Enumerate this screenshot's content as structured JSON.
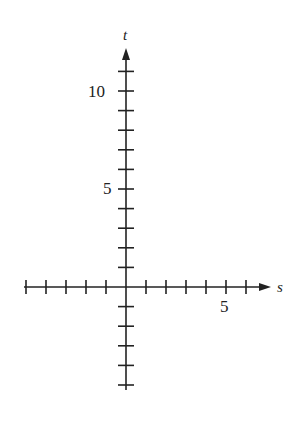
{
  "diagram": {
    "type": "coordinate-axes",
    "horizontal_axis": {
      "label": "s",
      "range": [
        -5,
        7
      ],
      "ticks": [
        -5,
        -4,
        -3,
        -2,
        -1,
        1,
        2,
        3,
        4,
        5,
        6
      ],
      "labeled_ticks": [
        {
          "value": 5,
          "text": "5"
        }
      ]
    },
    "vertical_axis": {
      "label": "t",
      "range": [
        -5,
        12
      ],
      "ticks": [
        -5,
        -4,
        -3,
        -2,
        -1,
        1,
        2,
        3,
        4,
        5,
        6,
        7,
        8,
        9,
        10,
        11
      ],
      "labeled_ticks": [
        {
          "value": 5,
          "text": "5"
        },
        {
          "value": 10,
          "text": "10"
        }
      ]
    },
    "colors": {
      "ink": "#222222",
      "background": "#ffffff"
    }
  },
  "labels": {
    "s_axis": "s",
    "t_axis": "t",
    "s_tick_5": "5",
    "t_tick_5": "5",
    "t_tick_10": "10"
  }
}
